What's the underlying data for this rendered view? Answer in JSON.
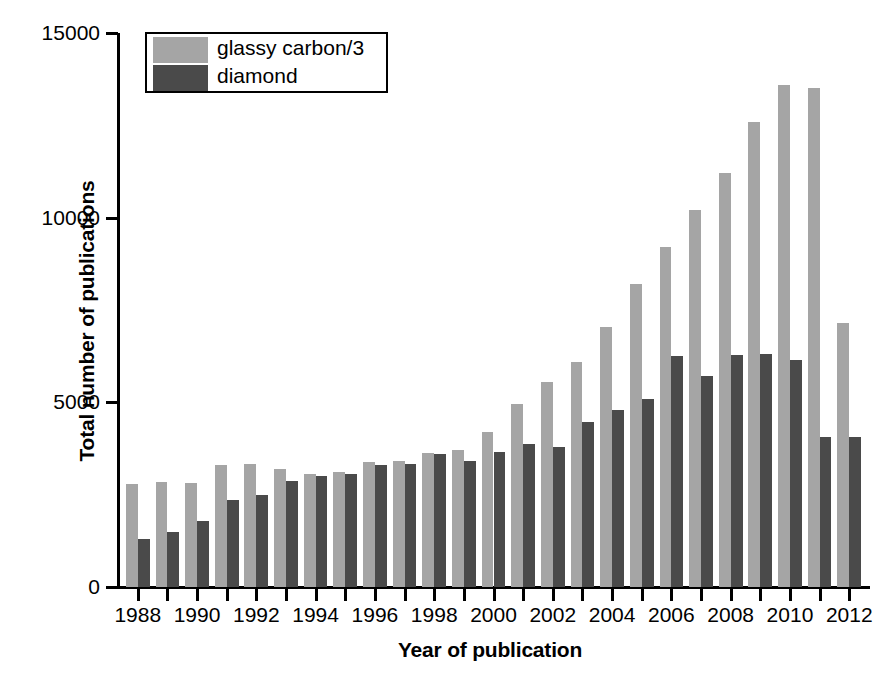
{
  "chart_data": {
    "type": "bar",
    "title": "",
    "xlabel": "Year of publication",
    "ylabel": "Total number of publications",
    "xlim": [
      1987.3,
      2012.7
    ],
    "ylim": [
      0,
      15000
    ],
    "grid": false,
    "legend_position": "top-left",
    "y_ticks": [
      {
        "value": 15000,
        "label": "15000"
      },
      {
        "value": 10000,
        "label": "10000"
      },
      {
        "value": 5000,
        "label": "5000"
      },
      {
        "value": 0,
        "label": "0"
      }
    ],
    "x_tick_labels": [
      "1988",
      "1990",
      "1992",
      "1994",
      "1996",
      "1998",
      "2000",
      "2002",
      "2004",
      "2006",
      "2008",
      "2010",
      "2012"
    ],
    "categories": [
      1988,
      1989,
      1990,
      1991,
      1992,
      1993,
      1994,
      1995,
      1996,
      1997,
      1998,
      1999,
      2000,
      2001,
      2002,
      2003,
      2004,
      2005,
      2006,
      2007,
      2008,
      2009,
      2010,
      2011,
      2012
    ],
    "series": [
      {
        "name": "glassy carbon/3",
        "color": "#a5a5a5",
        "values": [
          2800,
          2850,
          2820,
          3300,
          3320,
          3200,
          3050,
          3120,
          3380,
          3400,
          3620,
          3720,
          4200,
          4950,
          5550,
          6100,
          7050,
          8200,
          9200,
          10200,
          11200,
          12600,
          13600,
          13500,
          7150
        ]
      },
      {
        "name": "diamond",
        "color": "#4a4a4a",
        "values": [
          1300,
          1500,
          1780,
          2350,
          2480,
          2880,
          3000,
          3050,
          3300,
          3330,
          3600,
          3420,
          3650,
          3870,
          3780,
          4480,
          4800,
          5100,
          6250,
          5700,
          6280,
          6320,
          6150,
          4050,
          4050
        ]
      }
    ]
  },
  "legend": {
    "items": [
      {
        "label": "glassy carbon/3",
        "color": "#a5a5a5"
      },
      {
        "label": "diamond",
        "color": "#4a4a4a"
      }
    ]
  }
}
